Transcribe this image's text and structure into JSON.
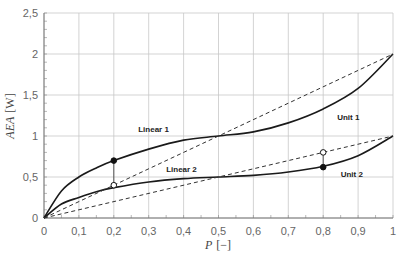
{
  "chart_data": {
    "type": "line",
    "title": "",
    "xlabel": "P [−]",
    "xlabel_var": "P",
    "xlabel_unit": "[−]",
    "ylabel": "AEA [W]",
    "ylabel_var": "AEA",
    "ylabel_unit": "[W]",
    "xlim": [
      0,
      1
    ],
    "ylim": [
      0,
      2.5
    ],
    "grid": true,
    "xticks": [
      "0",
      "0,1",
      "0,2",
      "0,3",
      "0,4",
      "0,5",
      "0,6",
      "0,7",
      "0,8",
      "0,9",
      "1"
    ],
    "yticks": [
      "0",
      "0,5",
      "1",
      "1,5",
      "2",
      "2,5"
    ],
    "series": [
      {
        "name": "Unit 1",
        "style": "solid",
        "x": [
          0,
          0.05,
          0.1,
          0.15,
          0.2,
          0.3,
          0.4,
          0.5,
          0.6,
          0.7,
          0.8,
          0.9,
          1.0
        ],
        "values": [
          0,
          0.33,
          0.5,
          0.61,
          0.7,
          0.84,
          0.95,
          1.0,
          1.05,
          1.16,
          1.33,
          1.58,
          2.0
        ]
      },
      {
        "name": "Unit 2",
        "style": "solid",
        "x": [
          0,
          0.05,
          0.1,
          0.15,
          0.2,
          0.3,
          0.4,
          0.5,
          0.6,
          0.7,
          0.8,
          0.9,
          1.0
        ],
        "values": [
          0,
          0.17,
          0.25,
          0.32,
          0.37,
          0.44,
          0.48,
          0.5,
          0.52,
          0.56,
          0.63,
          0.76,
          1.0
        ]
      },
      {
        "name": "Linear 1",
        "style": "dashed",
        "x": [
          0,
          1
        ],
        "values": [
          0,
          2
        ]
      },
      {
        "name": "Linear 2",
        "style": "dashed",
        "x": [
          0,
          1
        ],
        "values": [
          0,
          1
        ]
      }
    ],
    "annotations": [
      {
        "label": "Linear 1",
        "x": 0.27,
        "y": 1.05
      },
      {
        "label": "Unit 1",
        "x": 0.84,
        "y": 1.2
      },
      {
        "label": "Linear 2",
        "x": 0.35,
        "y": 0.56
      },
      {
        "label": "Unit 2",
        "x": 0.85,
        "y": 0.5
      }
    ],
    "markers": [
      {
        "x": 0.2,
        "y": 0.7,
        "filled": true
      },
      {
        "x": 0.2,
        "y": 0.4,
        "filled": false
      },
      {
        "x": 0.8,
        "y": 0.8,
        "filled": false
      },
      {
        "x": 0.8,
        "y": 0.62,
        "filled": true
      }
    ]
  }
}
